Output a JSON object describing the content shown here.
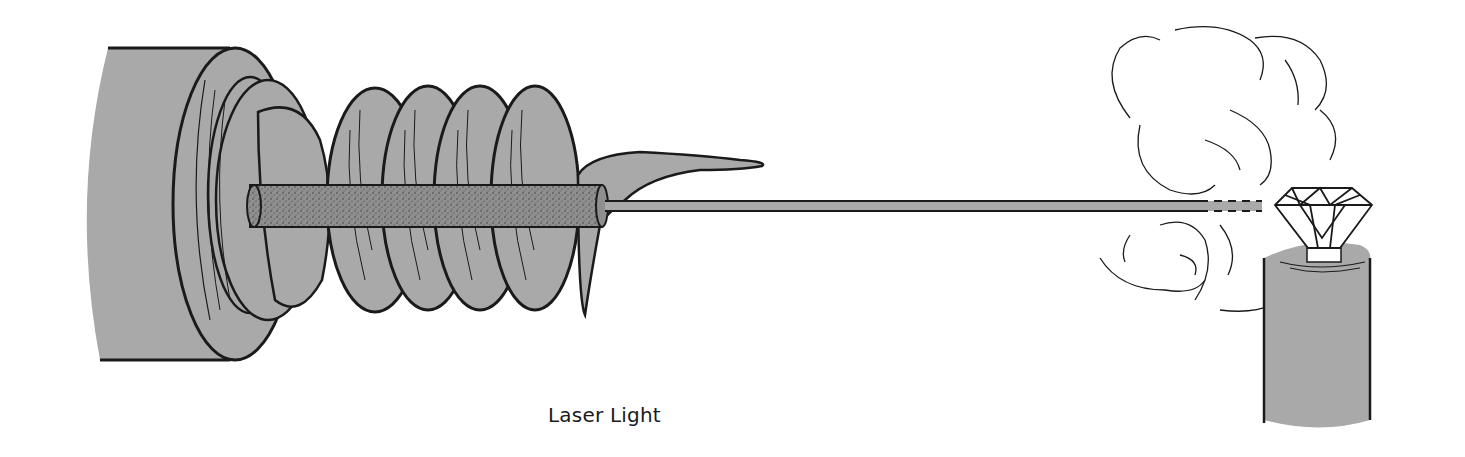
{
  "figure": {
    "caption": "Laser Light",
    "components": [
      {
        "name": "laser-housing",
        "description": "cylindrical laser body (left)"
      },
      {
        "name": "end-plate",
        "description": "flanged mounting plate"
      },
      {
        "name": "flash-tube-coil",
        "description": "helical flash lamp wound around rod",
        "turns": 5
      },
      {
        "name": "ruby-rod",
        "description": "stippled laser rod through coil center"
      },
      {
        "name": "laser-beam",
        "description": "thin horizontal beam to target"
      },
      {
        "name": "smoke-clouds",
        "description": "vapor puffs around impact point"
      },
      {
        "name": "diamond",
        "description": "faceted gem target"
      },
      {
        "name": "pedestal",
        "description": "cylindrical stand holding diamond"
      }
    ],
    "colors": {
      "fill": "#a9a9a9",
      "rod_fill": "#8f8f8f",
      "ink": "#1a1a1a",
      "background": "#ffffff"
    }
  }
}
